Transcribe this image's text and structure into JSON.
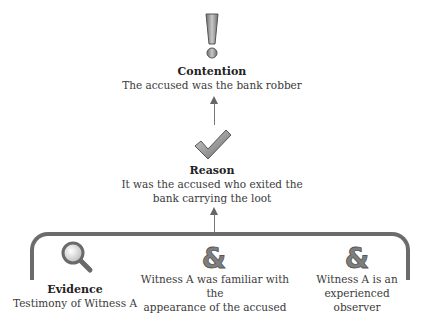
{
  "contention": {
    "icon": "exclamation-icon",
    "title": "Contention",
    "text": "The accused was the bank robber"
  },
  "reason": {
    "icon": "checkmark-icon",
    "title": "Reason",
    "text_line1": "It was the accused who exited the",
    "text_line2": "bank carrying the loot"
  },
  "evidence": {
    "icon": "magnifier-icon",
    "title": "Evidence",
    "text": "Testimony of Witness A"
  },
  "co_premises": [
    {
      "icon": "ampersand-icon",
      "text_line1": "Witness A was familiar with the",
      "text_line2": "appearance of the accused"
    },
    {
      "icon": "ampersand-icon",
      "text_line1": "Witness A is an",
      "text_line2": "experienced",
      "text_line3": "observer"
    }
  ],
  "colors": {
    "icon_gray": "#8a8a8a",
    "line_gray": "#6b6b6b",
    "arrow_gray": "#777777"
  }
}
